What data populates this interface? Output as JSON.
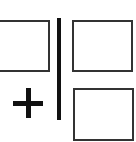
{
  "icon": {
    "name": "add-split-pane-icon",
    "colors": {
      "stroke": "#333333",
      "divider": "#111111",
      "plus": "#111111",
      "background": "#ffffff"
    },
    "panes": [
      {
        "id": "left-pane"
      },
      {
        "id": "top-right-pane"
      },
      {
        "id": "bottom-right-pane"
      }
    ],
    "symbol": "+"
  }
}
